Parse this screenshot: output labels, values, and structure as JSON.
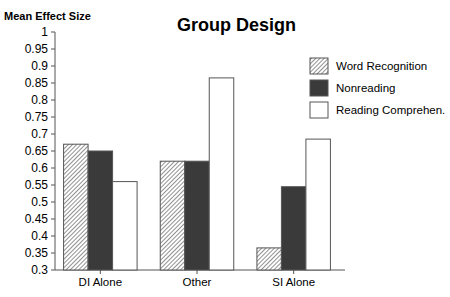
{
  "chart_data": {
    "type": "bar",
    "title": "Group Design",
    "xlabel": "",
    "ylabel": "Mean Effect Size",
    "ylim": [
      0.3,
      1.0
    ],
    "yticks": [
      "1",
      "0.95",
      "0.9",
      "0.85",
      "0.8",
      "0.75",
      "0.7",
      "0.65",
      "0.6",
      "0.55",
      "0.5",
      "0.45",
      "0.4",
      "0.35",
      "0.3"
    ],
    "grid": false,
    "legend_position": "right",
    "categories": [
      "DI Alone",
      "Other",
      "SI Alone"
    ],
    "series": [
      {
        "name": "Word Recognition",
        "fill": "hatched",
        "values": [
          0.67,
          0.62,
          0.365
        ]
      },
      {
        "name": "Nonreading",
        "fill": "dark",
        "values": [
          0.65,
          0.62,
          0.545
        ]
      },
      {
        "name": "Reading Comprehen.",
        "fill": "white",
        "values": [
          0.56,
          0.865,
          0.685
        ]
      }
    ]
  },
  "colors": {
    "axis": "#555555",
    "hatch_line": "#555555",
    "dark_fill": "#3a3a3a",
    "white_fill": "#ffffff",
    "bar_stroke": "#555555"
  }
}
